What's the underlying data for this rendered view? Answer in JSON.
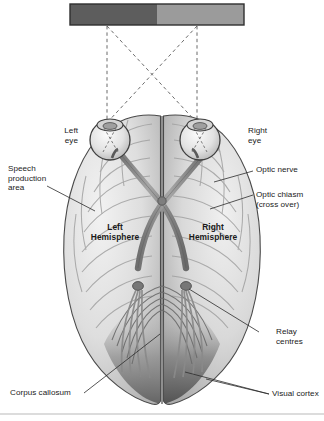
{
  "figure": {
    "colors": {
      "stimulus_left_half": "#5d5d5d",
      "stimulus_right_half": "#9b9b9b",
      "stimulus_border": "#2f2f2f",
      "brain_fill": "#dcdcdc",
      "brain_outline": "#4a4a4a",
      "tract": "#8c8c8c",
      "tract_outline": "#5a5a5a",
      "visual_cortex_shade": "#6f6f6f",
      "label_text": "#1a1a1a",
      "leader_line": "#2b2b2b",
      "sight_line": "#6b6b6b",
      "footer_rule": "#b9b9b9",
      "page_background": "#ffffff"
    },
    "stimulus_bar": {
      "name": "visual-field-bar",
      "left_half_label": "left visual field",
      "right_half_label": "right visual field"
    },
    "labels": [
      {
        "id": "left-eye",
        "text": "Left\neye",
        "bold": false
      },
      {
        "id": "right-eye",
        "text": "Right\neye",
        "bold": false
      },
      {
        "id": "speech-production",
        "text": "Speech\nproduction\narea",
        "bold": false
      },
      {
        "id": "optic-nerve",
        "text": "Optic nerve",
        "bold": false
      },
      {
        "id": "optic-chiasm",
        "text": "Optic chiasm\n(cross over)",
        "bold": false
      },
      {
        "id": "left-hemisphere",
        "text": "Left\nHemisphere",
        "bold": true
      },
      {
        "id": "right-hemisphere",
        "text": "Right\nHemisphere",
        "bold": true
      },
      {
        "id": "relay-centres",
        "text": "Relay\ncentres",
        "bold": false
      },
      {
        "id": "corpus-callosum",
        "text": "Corpus callosum",
        "bold": false
      },
      {
        "id": "visual-cortex",
        "text": "Visual cortex",
        "bold": false
      }
    ]
  }
}
